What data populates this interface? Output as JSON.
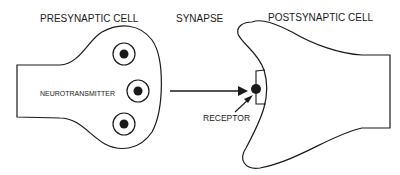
{
  "diagram": {
    "labels": {
      "presynaptic": "PRESYNAPTIC CELL",
      "synapse": "SYNAPSE",
      "postsynaptic": "POSTSYNAPTIC CELL",
      "neurotransmitter": "NEUROTRANSMITTER",
      "receptor": "RECEPTOR"
    },
    "colors": {
      "stroke": "#1a1a1a",
      "fill": "#ffffff"
    },
    "vesicles": [
      {
        "cx": 124,
        "cy": 54
      },
      {
        "cx": 138,
        "cy": 91
      },
      {
        "cx": 124,
        "cy": 126
      }
    ]
  }
}
